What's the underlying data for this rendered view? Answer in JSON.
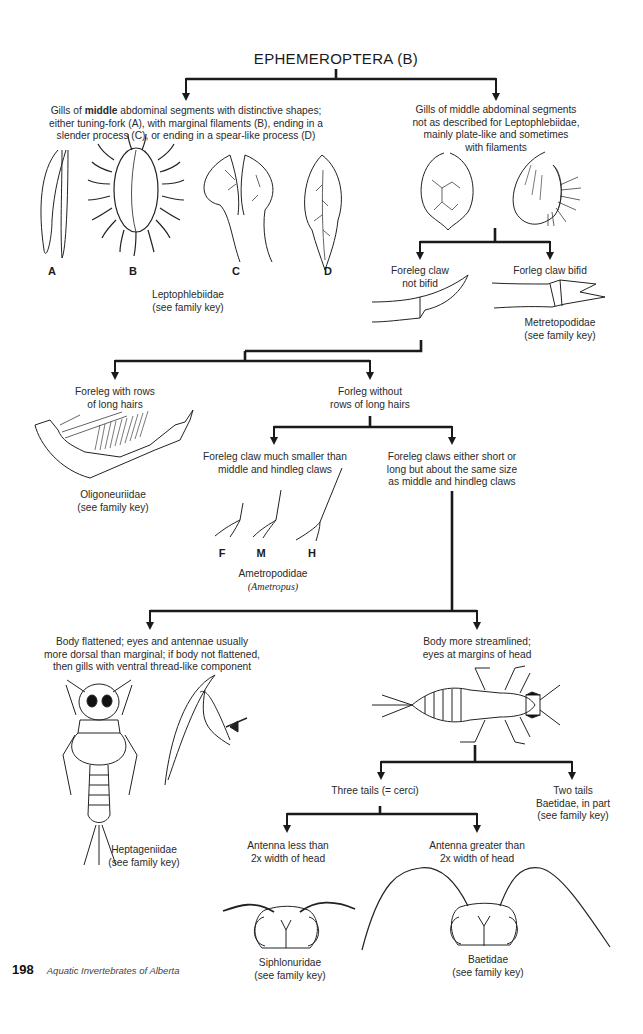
{
  "title": "EPHEMEROPTERA (B)",
  "nodes": {
    "gills_distinctive": {
      "text_pre": "Gills of ",
      "text_bold": "middle",
      "text_post": " abdominal segments with distinctive shapes;",
      "line2": "either tuning-fork (A), with marginal filaments (B), ending in a",
      "line3": "slender process (C), or ending in a spear-like process (D)"
    },
    "gill_labels": [
      "A",
      "B",
      "C",
      "D"
    ],
    "leptophlebiidae": {
      "name": "Leptophlebiidae",
      "note": "(see family key)"
    },
    "gills_plate": {
      "lines": [
        "Gills of middle abdominal segments",
        "not as described for Leptophlebiidae,",
        "mainly plate-like and sometimes",
        "with filaments"
      ]
    },
    "claw_not_bifid": {
      "lines": [
        "Foreleg claw",
        "not bifid"
      ]
    },
    "claw_bifid": {
      "lines": [
        "Forleg claw bifid"
      ]
    },
    "metretopodidae": {
      "name": "Metretopodidae",
      "note": "(see family key)"
    },
    "rows_long_hairs": {
      "lines": [
        "Foreleg with rows",
        "of long hairs"
      ]
    },
    "oligoneuriidae": {
      "name": "Oligoneuriidae",
      "note": "(see family key)"
    },
    "without_rows": {
      "lines": [
        "Forleg without",
        "rows of long hairs"
      ]
    },
    "claw_smaller": {
      "lines": [
        "Foreleg claw much smaller than",
        "middle and hindleg claws"
      ]
    },
    "claw_labels": [
      "F",
      "M",
      "H"
    ],
    "ametropodidae": {
      "name": "Ametropodidae",
      "genus": "(Ametropus)"
    },
    "claws_same": {
      "lines": [
        "Foreleg claws either short or",
        "long but about the same size",
        "as middle and hindleg claws"
      ]
    },
    "body_flattened": {
      "lines": [
        "Body flattened; eyes and antennae usually",
        "more dorsal than marginal; if body not flattened,",
        "then gills with ventral thread-like component"
      ]
    },
    "heptageniidae": {
      "name": "Heptageniidae",
      "note": "(see family key)"
    },
    "body_streamlined": {
      "lines": [
        "Body more streamlined;",
        "eyes at margins of head"
      ]
    },
    "three_tails": {
      "lines": [
        "Three tails (= cerci)"
      ]
    },
    "two_tails": {
      "lines": [
        "Two tails",
        "Baetidae, in part",
        "(see family key)"
      ]
    },
    "antenna_less": {
      "lines": [
        "Antenna less than",
        "2x width of head"
      ]
    },
    "siphlonuridae": {
      "name": "Siphlonuridae",
      "note": "(see family key)"
    },
    "antenna_greater": {
      "lines": [
        "Antenna greater than",
        "2x width of head"
      ]
    },
    "baetidae": {
      "name": "Baetidae",
      "note": "(see family key)"
    }
  },
  "footer": {
    "page_number": "198",
    "book_title": "Aquatic Invertebrates of Alberta"
  }
}
